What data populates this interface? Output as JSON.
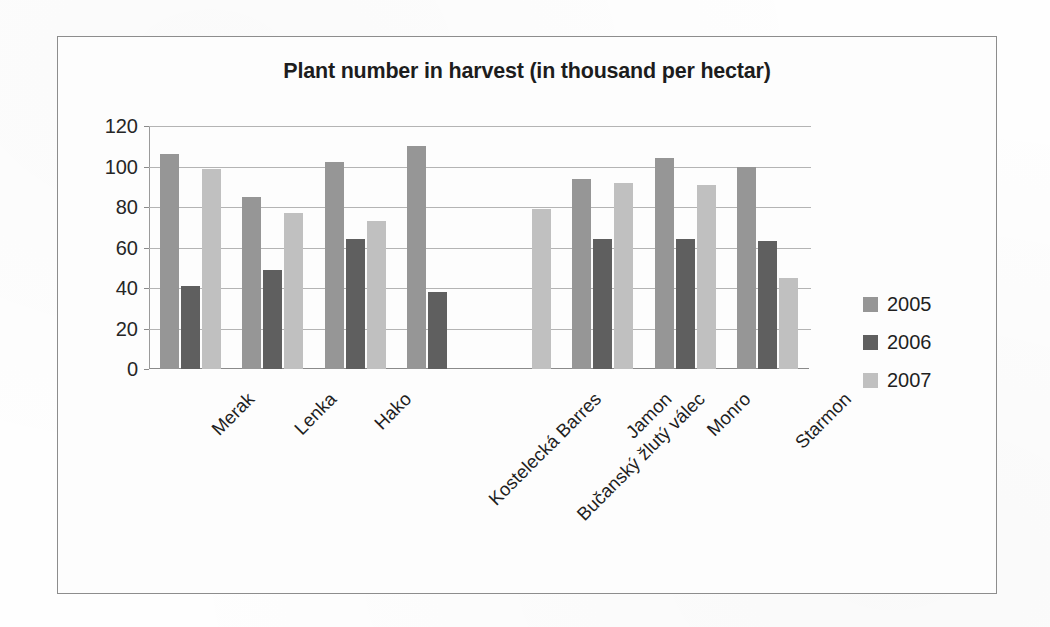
{
  "chart_data": {
    "type": "bar",
    "title": "Plant number in harvest (in thousand per hectar)",
    "xlabel": "",
    "ylabel": "",
    "ylim": [
      0,
      120
    ],
    "yticks": [
      0,
      20,
      40,
      60,
      80,
      100,
      120
    ],
    "grid": true,
    "legend_position": "right",
    "categories": [
      "Merak",
      "Lenka",
      "Hako",
      "Kostelecká Barres",
      "Bučanský žlutý válec",
      "Jamon",
      "Monro",
      "Starmon"
    ],
    "series": [
      {
        "name": "2005",
        "color": "#969696",
        "values": [
          106,
          85,
          102,
          110,
          null,
          94,
          104,
          100
        ]
      },
      {
        "name": "2006",
        "color": "#5f5f5f",
        "values": [
          41,
          49,
          64,
          38,
          null,
          64,
          64,
          63
        ]
      },
      {
        "name": "2007",
        "color": "#c0c0c0",
        "values": [
          99,
          77,
          73,
          null,
          79,
          92,
          91,
          45
        ]
      }
    ]
  },
  "legend": {
    "items": [
      {
        "label": "2005",
        "color": "#969696"
      },
      {
        "label": "2006",
        "color": "#5f5f5f"
      },
      {
        "label": "2007",
        "color": "#c0c0c0"
      }
    ]
  },
  "axis": {
    "y_tick_labels": [
      "120",
      "100",
      "80",
      "60",
      "40",
      "20",
      "0"
    ]
  }
}
